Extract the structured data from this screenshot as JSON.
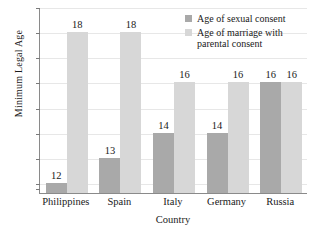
{
  "chart_data": {
    "type": "bar",
    "title": "",
    "xlabel": "Country",
    "ylabel": "Minimum Legal Age",
    "categories": [
      "Philippines",
      "Spain",
      "Italy",
      "Germany",
      "Russia"
    ],
    "series": [
      {
        "name": "Age of sexual consent",
        "color": "#a9a9a9",
        "values": [
          12,
          13,
          14,
          14,
          16
        ]
      },
      {
        "name": "Age of marriage with parental consent",
        "color": "#d7d7d7",
        "values": [
          18,
          18,
          16,
          16,
          16
        ]
      }
    ],
    "ylim": [
      11.6,
      19
    ],
    "yticks": [
      12,
      13,
      14,
      15,
      16,
      17,
      18,
      19
    ],
    "ytick_labels": [
      "12",
      "13",
      "14",
      "15",
      "16",
      "17",
      "18",
      "19"
    ],
    "grid": true,
    "legend_position": "top-right",
    "legend_entries": [
      "Age of sexual consent",
      "Age of marriage with parental consent"
    ],
    "data_labels": true,
    "annotations": []
  },
  "legend": {
    "entry_1_line_1": "Age of sexual consent",
    "entry_2_line_1": "Age of marriage with",
    "entry_2_line_2": "parental consent"
  }
}
